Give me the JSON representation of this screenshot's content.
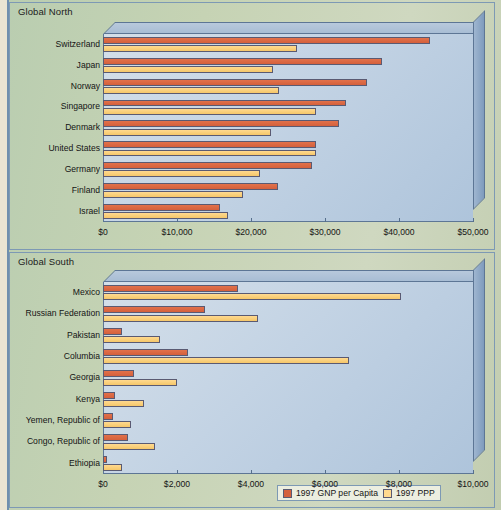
{
  "chart_data": [
    {
      "type": "bar",
      "title": "Global North",
      "orientation": "horizontal",
      "xlabel": "",
      "ylabel": "",
      "xlim": [
        0,
        50000
      ],
      "xticks": [
        0,
        10000,
        20000,
        30000,
        40000,
        50000
      ],
      "xtick_labels": [
        "$0",
        "$10,000",
        "$20,000",
        "$30,000",
        "$40,000",
        "$50,000"
      ],
      "grid": false,
      "legend_position": "bottom-right",
      "categories": [
        "Switzerland",
        "Japan",
        "Norway",
        "Singapore",
        "Denmark",
        "United States",
        "Germany",
        "Finland",
        "Israel"
      ],
      "series": [
        {
          "name": "1997 GNP per Capita",
          "color": "#d4603c",
          "values": [
            44200,
            37700,
            35700,
            32800,
            31900,
            28800,
            28200,
            23700,
            15800
          ]
        },
        {
          "name": "1997 PPP",
          "color": "#ffd98f",
          "values": [
            26200,
            23000,
            23800,
            28800,
            22700,
            28800,
            21200,
            18900,
            16900
          ]
        }
      ]
    },
    {
      "type": "bar",
      "title": "Global South",
      "orientation": "horizontal",
      "xlabel": "",
      "ylabel": "",
      "xlim": [
        0,
        10000
      ],
      "xticks": [
        0,
        2000,
        4000,
        6000,
        8000,
        10000
      ],
      "xtick_labels": [
        "$0",
        "$2,000",
        "$4,000",
        "$6,000",
        "$8,000",
        "$10,000"
      ],
      "grid": false,
      "legend_position": "bottom-right",
      "categories": [
        "Mexico",
        "Russian Federation",
        "Pakistan",
        "Columbia",
        "Georgia",
        "Kenya",
        "Yemen, Republic of",
        "Congo, Republic of",
        "Ethiopia"
      ],
      "series": [
        {
          "name": "1997 GNP per Capita",
          "color": "#d4603c",
          "values": [
            3650,
            2750,
            500,
            2300,
            850,
            330,
            280,
            670,
            110
          ]
        },
        {
          "name": "1997 PPP",
          "color": "#ffd98f",
          "values": [
            8050,
            4200,
            1550,
            6650,
            2000,
            1100,
            750,
            1400,
            500
          ]
        }
      ]
    }
  ],
  "legend": {
    "items": [
      {
        "label": "1997 GNP per Capita",
        "color": "#d4603c"
      },
      {
        "label": "1997 PPP",
        "color": "#ffd98f"
      }
    ]
  }
}
